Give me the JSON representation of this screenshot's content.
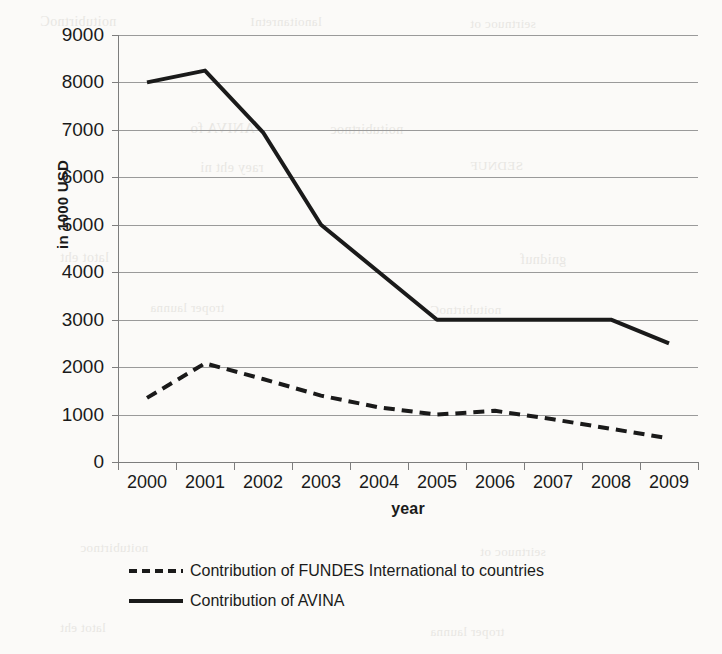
{
  "chart_data": {
    "type": "line",
    "title": "",
    "subtitle": "",
    "xlabel": "year",
    "ylabel": "in 1000 USD",
    "categories": [
      "2000",
      "2001",
      "2002",
      "2003",
      "2004",
      "2005",
      "2006",
      "2007",
      "2008",
      "2009"
    ],
    "ylim": [
      0,
      9000
    ],
    "ytick_values": [
      0,
      1000,
      2000,
      3000,
      4000,
      5000,
      6000,
      7000,
      8000,
      9000
    ],
    "ytick_labels": [
      "0",
      "1000",
      "2000",
      "3000",
      "4000",
      "5000",
      "6000",
      "7000",
      "8000",
      "9000"
    ],
    "grid": true,
    "legend_position": "bottom-left",
    "series": [
      {
        "name": "Contribution of FUNDES International to countries",
        "style": "dashed",
        "color": "#1a1a1a",
        "values": [
          1350,
          2080,
          1750,
          1400,
          1150,
          1000,
          1080,
          900,
          700,
          500
        ]
      },
      {
        "name": "Contribution of AVINA",
        "style": "solid",
        "color": "#1a1a1a",
        "values": [
          8000,
          8250,
          6950,
          5000,
          4000,
          3000,
          3000,
          3000,
          3000,
          2500
        ]
      }
    ]
  },
  "legend": {
    "items": [
      {
        "label": "Contribution of FUNDES International to countries",
        "style": "dashed"
      },
      {
        "label": "Contribution of AVINA",
        "style": "solid"
      }
    ]
  },
  "background_artifacts": [
    "noitubirtnoC",
    "lanoitanretnI",
    "seirtnuoc ot",
    "ANIVA fo",
    "noitubirtnoc",
    "raey eht ni",
    "SEDNUF",
    "latot eht",
    "gnidnuf",
    "troper launna"
  ]
}
